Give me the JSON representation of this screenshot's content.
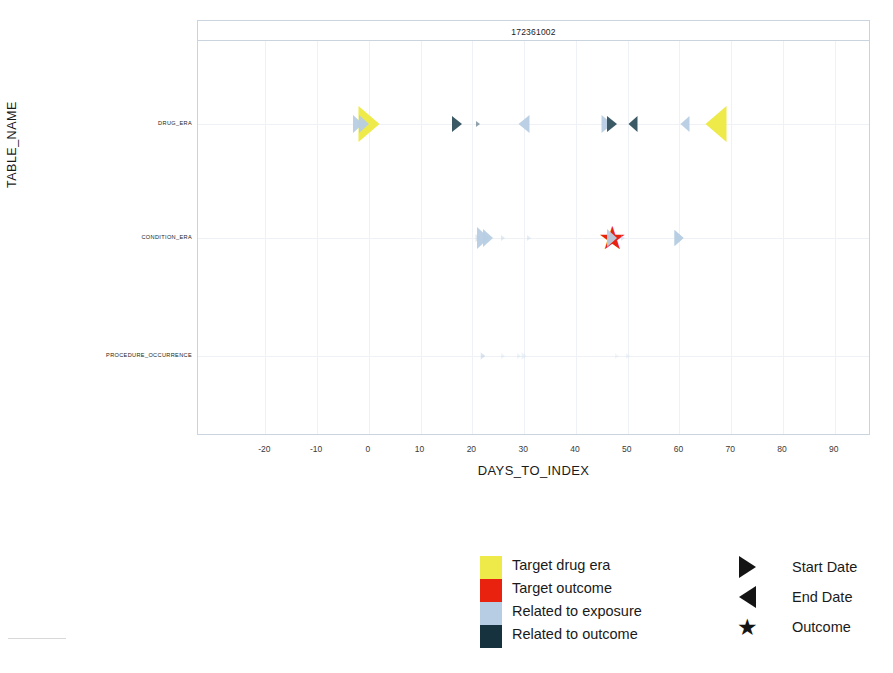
{
  "chart_data": {
    "type": "scatter",
    "title": "172361002",
    "xlabel": "DAYS_TO_INDEX",
    "ylabel": "TABLE_NAME",
    "xlim": [
      -33,
      97
    ],
    "xticks": [
      -20,
      -10,
      0,
      10,
      20,
      30,
      40,
      50,
      60,
      70,
      80,
      90
    ],
    "xtick_labels": [
      "-20",
      "-10",
      "0",
      "10",
      "20",
      "30",
      "40",
      "50",
      "60",
      "70",
      "80",
      "90"
    ],
    "categories": [
      "DRUG_ERA",
      "CONDITION_ERA",
      "PROCEDURE_OCCURRENCE"
    ],
    "grid": true,
    "legend_position": "bottom",
    "colors": {
      "target_drug_era": "#edea4a",
      "target_outcome": "#e8220f",
      "related_to_exposure": "#b7cde3",
      "related_to_outcome": "#16323f"
    },
    "series": [
      {
        "name": "Target drug era",
        "color": "#edea4a",
        "points": [
          {
            "row": "DRUG_ERA",
            "x": 0,
            "shape": "start",
            "size": 30,
            "opacity": 1.0
          },
          {
            "row": "DRUG_ERA",
            "x": 67,
            "shape": "end",
            "size": 30,
            "opacity": 1.0
          }
        ]
      },
      {
        "name": "Target outcome",
        "color": "#e8220f",
        "points": [
          {
            "row": "CONDITION_ERA",
            "x": 47,
            "shape": "star",
            "size": 32,
            "opacity": 1.0
          }
        ]
      },
      {
        "name": "Related to exposure",
        "color": "#b7cde3",
        "points": [
          {
            "row": "DRUG_ERA",
            "x": -2,
            "shape": "start",
            "size": 15,
            "opacity": 0.95
          },
          {
            "row": "DRUG_ERA",
            "x": -1,
            "shape": "start",
            "size": 15,
            "opacity": 0.95
          },
          {
            "row": "DRUG_ERA",
            "x": 30,
            "shape": "end",
            "size": 16,
            "opacity": 0.95
          },
          {
            "row": "DRUG_ERA",
            "x": 46,
            "shape": "start",
            "size": 16,
            "opacity": 0.95
          },
          {
            "row": "DRUG_ERA",
            "x": 61,
            "shape": "end",
            "size": 13,
            "opacity": 0.95
          },
          {
            "row": "CONDITION_ERA",
            "x": 22,
            "shape": "start",
            "size": 18,
            "opacity": 0.95
          },
          {
            "row": "CONDITION_ERA",
            "x": 23,
            "shape": "start",
            "size": 15,
            "opacity": 0.95
          },
          {
            "row": "CONDITION_ERA",
            "x": 47,
            "shape": "start",
            "size": 15,
            "opacity": 0.95
          },
          {
            "row": "CONDITION_ERA",
            "x": 60,
            "shape": "start",
            "size": 13,
            "opacity": 0.95
          },
          {
            "row": "CONDITION_ERA",
            "x": 60,
            "shape": "start",
            "size": 13,
            "opacity": 0.95
          },
          {
            "row": "CONDITION_ERA",
            "x": 21,
            "shape": "start",
            "size": 7,
            "opacity": 0.45
          },
          {
            "row": "CONDITION_ERA",
            "x": 26,
            "shape": "start",
            "size": 6,
            "opacity": 0.4
          },
          {
            "row": "CONDITION_ERA",
            "x": 31,
            "shape": "start",
            "size": 6,
            "opacity": 0.35
          },
          {
            "row": "CONDITION_ERA",
            "x": 49,
            "shape": "start",
            "size": 6,
            "opacity": 0.4
          },
          {
            "row": "PROCEDURE_OCCURRENCE",
            "x": 22,
            "shape": "start",
            "size": 8,
            "opacity": 0.25
          },
          {
            "row": "PROCEDURE_OCCURRENCE",
            "x": 22,
            "shape": "start",
            "size": 6,
            "opacity": 0.22
          },
          {
            "row": "PROCEDURE_OCCURRENCE",
            "x": 22,
            "shape": "start",
            "size": 6,
            "opacity": 0.2
          },
          {
            "row": "PROCEDURE_OCCURRENCE",
            "x": 26,
            "shape": "start",
            "size": 6,
            "opacity": 0.22
          },
          {
            "row": "PROCEDURE_OCCURRENCE",
            "x": 29,
            "shape": "start",
            "size": 6,
            "opacity": 0.22
          },
          {
            "row": "PROCEDURE_OCCURRENCE",
            "x": 30,
            "shape": "start",
            "size": 7,
            "opacity": 0.22
          },
          {
            "row": "PROCEDURE_OCCURRENCE",
            "x": 48,
            "shape": "start",
            "size": 6,
            "opacity": 0.18
          },
          {
            "row": "PROCEDURE_OCCURRENCE",
            "x": 50,
            "shape": "start",
            "size": 6,
            "opacity": 0.2
          }
        ]
      },
      {
        "name": "Related to outcome",
        "color": "#3c5a66",
        "points": [
          {
            "row": "DRUG_ERA",
            "x": 17,
            "shape": "start",
            "size": 14,
            "opacity": 1.0
          },
          {
            "row": "DRUG_ERA",
            "x": 21,
            "shape": "start",
            "size": 6,
            "opacity": 0.55
          },
          {
            "row": "DRUG_ERA",
            "x": 47,
            "shape": "start",
            "size": 14,
            "opacity": 1.0
          },
          {
            "row": "DRUG_ERA",
            "x": 51,
            "shape": "end",
            "size": 13,
            "opacity": 1.0
          }
        ]
      }
    ]
  },
  "axis": {
    "y_title": "TABLE_NAME",
    "x_title": "DAYS_TO_INDEX",
    "y_categories": [
      "DRUG_ERA",
      "CONDITION_ERA",
      "PROCEDURE_OCCURRENCE"
    ]
  },
  "panel": {
    "title": "172361002"
  },
  "legend": {
    "color_items": [
      {
        "label": "Target drug era",
        "color": "#edea4a"
      },
      {
        "label": "Target outcome",
        "color": "#e8220f"
      },
      {
        "label": "Related to exposure",
        "color": "#b7cde3"
      },
      {
        "label": "Related to outcome",
        "color": "#16323f"
      }
    ],
    "shape_items": [
      {
        "label": "Start Date",
        "icon": "triangle-right-icon"
      },
      {
        "label": "End Date",
        "icon": "triangle-left-icon"
      },
      {
        "label": "Outcome",
        "icon": "star-icon"
      }
    ]
  }
}
